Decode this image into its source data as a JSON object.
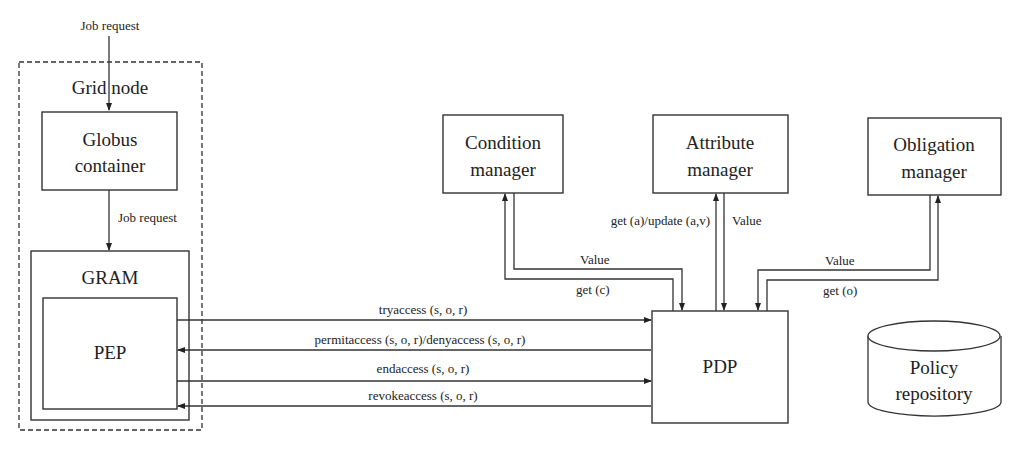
{
  "diagram": {
    "external_input": "Job request",
    "grid_node": {
      "label": "Grid node"
    },
    "globus_container": {
      "line1": "Globus",
      "line2": "container"
    },
    "inner_job_request": "Job request",
    "gram": {
      "label": "GRAM"
    },
    "pep": {
      "label": "PEP"
    },
    "pdp": {
      "label": "PDP"
    },
    "condition_manager": {
      "line1": "Condition",
      "line2": "manager"
    },
    "attribute_manager": {
      "line1": "Attribute",
      "line2": "manager"
    },
    "obligation_manager": {
      "line1": "Obligation",
      "line2": "manager"
    },
    "policy_repository": {
      "line1": "Policy",
      "line2": "repository"
    },
    "messages": {
      "tryaccess": "tryaccess (s, o, r)",
      "permit_deny": "permitaccess (s, o, r)/denyaccess (s, o, r)",
      "endaccess": "endaccess (s, o, r)",
      "revokeaccess": "revokeaccess (s, o, r)"
    },
    "condition_links": {
      "value": "Value",
      "get": "get (c)"
    },
    "attribute_links": {
      "get_update": "get (a)/update (a,v)",
      "value": "Value"
    },
    "obligation_links": {
      "value": "Value",
      "get": "get (o)"
    }
  }
}
